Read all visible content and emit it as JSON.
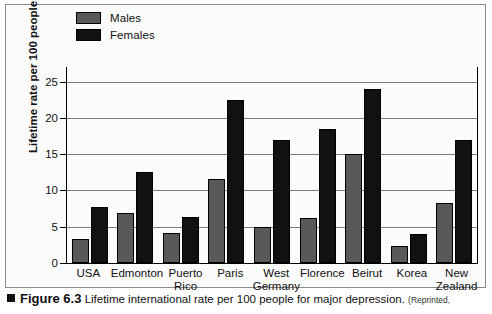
{
  "chart_data": {
    "type": "bar",
    "title": "",
    "xlabel": "",
    "ylabel": "Lifetime rate per 100 people",
    "ylim": [
      0,
      27
    ],
    "yticks": [
      0,
      5,
      10,
      15,
      20,
      25
    ],
    "grid": true,
    "legend_position": "top-left",
    "categories": [
      "USA",
      "Edmonton",
      "Puerto Rico",
      "Paris",
      "West Germany",
      "Florence",
      "Beirut",
      "Korea",
      "New Zealand"
    ],
    "category_lines": [
      [
        "USA"
      ],
      [
        "Edmonton"
      ],
      [
        "Puerto",
        "Rico"
      ],
      [
        "Paris"
      ],
      [
        "West",
        "Germany"
      ],
      [
        "Florence"
      ],
      [
        "Beirut"
      ],
      [
        "Korea"
      ],
      [
        "New",
        "Zealand"
      ]
    ],
    "series": [
      {
        "name": "Males",
        "color": "#595959",
        "values": [
          3.3,
          6.9,
          4.1,
          11.6,
          5.0,
          6.2,
          15.0,
          2.3,
          8.3
        ]
      },
      {
        "name": "Females",
        "color": "#111111",
        "values": [
          7.7,
          12.5,
          6.3,
          22.5,
          17.0,
          18.4,
          24.0,
          4.0,
          17.0
        ]
      }
    ]
  },
  "legend": {
    "items": [
      {
        "label": "Males",
        "color": "#595959"
      },
      {
        "label": "Females",
        "color": "#111111"
      }
    ]
  },
  "caption": {
    "figure_number": "Figure 6.3",
    "text": "Lifetime international rate per 100 people for major depression.",
    "credit": "(Reprinted,"
  }
}
